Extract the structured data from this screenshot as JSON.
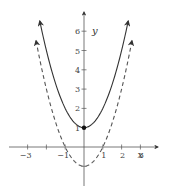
{
  "chart_data": {
    "type": "line",
    "title": "",
    "xlabel": "x",
    "ylabel": "y",
    "xlim": [
      -3.5,
      3.5
    ],
    "ylim": [
      -2,
      6.8
    ],
    "grid": false,
    "legend": null,
    "x_ticks": [
      -3,
      -2,
      -1,
      1,
      2,
      3
    ],
    "x_tick_labels": [
      "−3",
      "",
      "−1",
      "1",
      "2",
      "3"
    ],
    "y_ticks": [
      -1,
      1,
      2,
      3,
      4,
      5,
      6
    ],
    "y_tick_labels": [
      "",
      "1",
      "2",
      "3",
      "4",
      "5",
      "6"
    ],
    "series": [
      {
        "name": "y = x^2 + 1",
        "style": "solid",
        "color": "#333333",
        "formula": "x^2 + 1",
        "x_range": [
          -2.35,
          2.35
        ],
        "x": [
          -2.35,
          -2,
          -1.5,
          -1,
          -0.5,
          0,
          0.5,
          1,
          1.5,
          2,
          2.35
        ],
        "y": [
          6.52,
          5,
          3.25,
          2,
          1.25,
          1,
          1.25,
          2,
          3.25,
          5,
          6.52
        ]
      },
      {
        "name": "y = x^2 - 1",
        "style": "dashed",
        "color": "#555555",
        "formula": "x^2 - 1",
        "x_range": [
          -2.55,
          2.55
        ],
        "x": [
          -2.55,
          -2,
          -1.5,
          -1,
          -0.5,
          0,
          0.5,
          1,
          1.5,
          2,
          2.55
        ],
        "y": [
          5.5,
          3,
          1.25,
          0,
          -0.75,
          -1,
          -0.75,
          0,
          1.25,
          3,
          5.5
        ]
      }
    ],
    "points": [
      {
        "x": 0,
        "y": 1,
        "label": "vertex of solid curve",
        "filled": true
      }
    ]
  },
  "axes": {
    "x_label": "x",
    "y_label": "y"
  }
}
